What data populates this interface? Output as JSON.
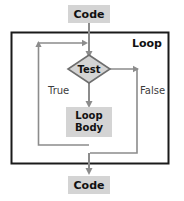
{
  "diagram": {
    "type": "flowchart",
    "title_label": "Loop",
    "colors": {
      "node_fill": "#d4d4d4",
      "node_fill_light": "#d9d9d9",
      "text": "#111111",
      "arrow": "#8c8c8c",
      "border": "#1a1a1a",
      "diamond_stroke": "#6e6e6e",
      "background": "#ffffff",
      "label_text": "#3c3c3c"
    },
    "nodes": [
      {
        "id": "code-top",
        "shape": "rect",
        "label": "Code",
        "label_lines": [
          "Code"
        ]
      },
      {
        "id": "test",
        "shape": "diamond",
        "label": "Test",
        "label_lines": [
          "Test"
        ]
      },
      {
        "id": "loop-body",
        "shape": "rect",
        "label": "Loop Body",
        "label_lines": [
          "Loop",
          "Body"
        ]
      },
      {
        "id": "code-bottom",
        "shape": "rect",
        "label": "Code",
        "label_lines": [
          "Code"
        ]
      }
    ],
    "edges": [
      {
        "id": "edge-code-to-test",
        "from": "code-top",
        "to": "test",
        "label": ""
      },
      {
        "id": "edge-test-to-body",
        "from": "test",
        "to": "loop-body",
        "label": "True"
      },
      {
        "id": "edge-test-to-exit",
        "from": "test",
        "to": "code-bottom",
        "label": "False"
      },
      {
        "id": "edge-body-to-test",
        "from": "loop-body",
        "to": "test",
        "label": ""
      }
    ],
    "edge_labels": {
      "true": "True",
      "false": "False"
    },
    "container": {
      "id": "loop-container",
      "label": "Loop"
    }
  }
}
